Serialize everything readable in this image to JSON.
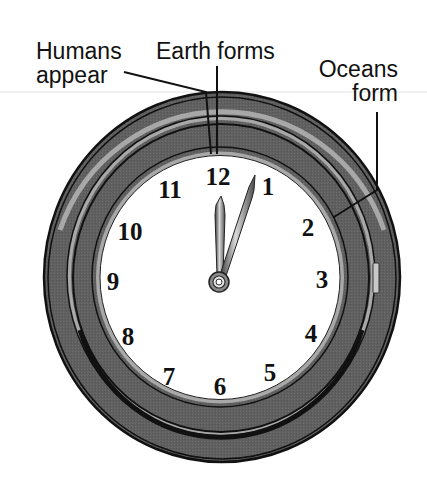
{
  "diagram": {
    "type": "geologic-time-clock",
    "labels": {
      "humans": {
        "line1": "Humans",
        "line2": "appear"
      },
      "earth": {
        "text": "Earth forms"
      },
      "oceans": {
        "line1": "Oceans",
        "line2": "form"
      }
    },
    "clock": {
      "numerals": [
        "12",
        "1",
        "2",
        "3",
        "4",
        "5",
        "6",
        "7",
        "8",
        "9",
        "10",
        "11"
      ],
      "hour_hand_points_to": "12",
      "minute_hand_points_to": "1"
    },
    "colors": {
      "ring_dark": "#5e5e5e",
      "ring_light": "#a8a8a8",
      "ring_line": "#111111",
      "face": "#ffffff",
      "text": "#111111",
      "hand_metal": "#8a8a8a"
    }
  }
}
